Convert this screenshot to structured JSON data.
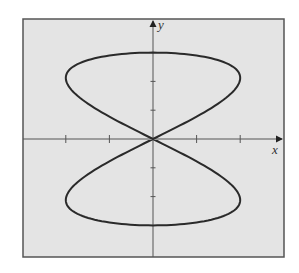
{
  "chart_data": {
    "type": "line",
    "title": "",
    "xlabel": "x",
    "ylabel": "y",
    "xlim": [
      -3.5,
      3
    ],
    "ylim": [
      -4.1,
      4.3
    ],
    "x_ticks": [
      -2,
      -1,
      1,
      2
    ],
    "y_ticks": [
      -2,
      -1,
      1,
      2
    ],
    "tick_labels_shown": false,
    "grid": false,
    "legend": null,
    "series": [
      {
        "name": "curve",
        "parametric": {
          "x": "2*sin(2t)",
          "y": "3*cos(t)",
          "t_range": [
            0,
            6.2832
          ]
        },
        "points": [
          [
            0,
            3
          ],
          [
            1,
            2.9
          ],
          [
            1.73,
            2.6
          ],
          [
            2,
            2.12
          ],
          [
            1.73,
            1.5
          ],
          [
            1,
            0.78
          ],
          [
            0,
            0
          ],
          [
            -1,
            -0.78
          ],
          [
            -1.73,
            -1.5
          ],
          [
            -2,
            -2.12
          ],
          [
            -1.73,
            -2.6
          ],
          [
            -1,
            -2.9
          ],
          [
            0,
            -3
          ],
          [
            1,
            -2.9
          ],
          [
            1.73,
            -2.6
          ],
          [
            2,
            -2.12
          ],
          [
            1.73,
            -1.5
          ],
          [
            1,
            -0.78
          ],
          [
            0,
            0
          ],
          [
            -1,
            0.78
          ],
          [
            -1.73,
            1.5
          ],
          [
            -2,
            2.12
          ],
          [
            -1.73,
            2.6
          ],
          [
            -1,
            2.9
          ],
          [
            0,
            3
          ]
        ]
      }
    ]
  },
  "colors": {
    "plot_background": "#e4e4e4",
    "frame": "#555555",
    "axis": "#555555",
    "curve": "#2a2a2a",
    "page": "#ffffff"
  },
  "labels": {
    "x": "x",
    "y": "y"
  }
}
